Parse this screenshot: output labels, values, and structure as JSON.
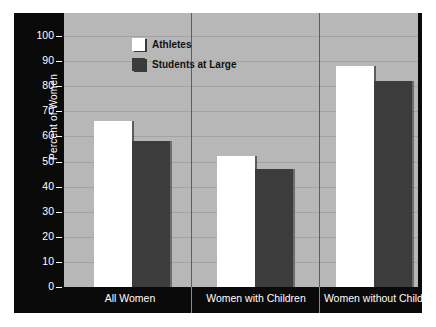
{
  "chart_data": {
    "type": "bar",
    "title": "",
    "xlabel": "",
    "ylabel": "Percent of Women",
    "ylim": [
      0,
      100
    ],
    "ytick_step": 10,
    "yticks": [
      0,
      10,
      20,
      30,
      40,
      50,
      60,
      70,
      80,
      90,
      100
    ],
    "grid": true,
    "legend_position": "top-center",
    "categories": [
      "All Women",
      "Women with Children",
      "Women without Children"
    ],
    "series": [
      {
        "name": "Athletes",
        "color": "#ffffff",
        "values": [
          66,
          52,
          88
        ],
        "data_labels": [
          "66%",
          "52%",
          "88%"
        ]
      },
      {
        "name": "Students at Large",
        "color": "#3c3c3c",
        "values": [
          58,
          47,
          82
        ],
        "data_labels": [
          "58%",
          "47%",
          "82%"
        ]
      }
    ]
  },
  "colors": {
    "panel_background": "#0a0a0a",
    "plot_background": "#b7b7b7",
    "gridline": "#a2a2a2",
    "divider": "#5d5d5d",
    "axis_text": "#ffffff",
    "data_label_text": "#1b1b1b"
  }
}
